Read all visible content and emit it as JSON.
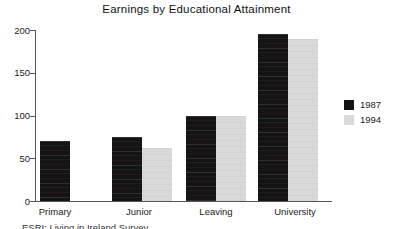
{
  "chart_data": {
    "type": "bar",
    "title": "Earnings by Educational Attainment",
    "categories": [
      "Primary",
      "Junior",
      "Leaving",
      "University"
    ],
    "series": [
      {
        "name": "1987",
        "color": "#141414",
        "values": [
          70,
          75,
          100,
          195
        ]
      },
      {
        "name": "1994",
        "color": "#d9d9d9",
        "values": [
          null,
          62,
          100,
          190
        ]
      }
    ],
    "xlabel": "",
    "ylabel": "",
    "ylim": [
      0,
      200
    ],
    "yticks": [
      0,
      50,
      100,
      150,
      200
    ],
    "legend_position": "right",
    "grid": false
  },
  "source_note": "ESRI: Living in Ireland Survey",
  "colors": {
    "background": "#ffffff",
    "axis": "#555555",
    "text": "#222222",
    "series_1987": "#141414",
    "series_1994": "#d9d9d9"
  }
}
